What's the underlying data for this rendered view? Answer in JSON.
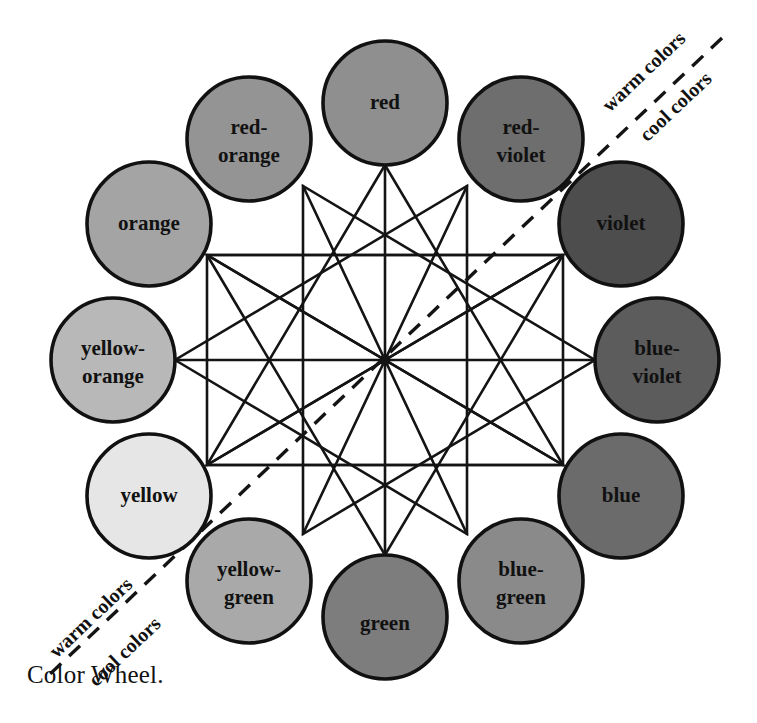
{
  "figure": {
    "caption": "Color Wheel.",
    "type": "diagram",
    "title": "Color Wheel",
    "center": {
      "x": 385,
      "y": 360
    },
    "wheel_radius": 272,
    "swatch_radius": 62
  },
  "divider": {
    "warm_label_top_right": "warm colors",
    "cool_label_top_right": "cool colors",
    "warm_label_bottom_left": "warm colors",
    "cool_label_bottom_left": "cool colors",
    "style": "dashed",
    "color": "#141414"
  },
  "swatches": [
    {
      "id": "red",
      "label": "red",
      "lines": [
        "red"
      ],
      "angle_deg": -90,
      "fill": "#8f8f8f",
      "stroke": "#111111",
      "family": "warm",
      "cx": 385,
      "cy": 103
    },
    {
      "id": "red-violet",
      "label": "red-violet",
      "lines": [
        "red-",
        "violet"
      ],
      "angle_deg": -60,
      "fill": "#6e6e6e",
      "stroke": "#111111",
      "family": "warm",
      "cx": 521,
      "cy": 139
    },
    {
      "id": "violet",
      "label": "violet",
      "lines": [
        "violet"
      ],
      "angle_deg": -30,
      "fill": "#4d4d4d",
      "stroke": "#111111",
      "family": "cool",
      "cx": 621,
      "cy": 224
    },
    {
      "id": "blue-violet",
      "label": "blue-violet",
      "lines": [
        "blue-",
        "violet"
      ],
      "angle_deg": 0,
      "fill": "#5c5c5c",
      "stroke": "#111111",
      "family": "cool",
      "cx": 657,
      "cy": 360
    },
    {
      "id": "blue",
      "label": "blue",
      "lines": [
        "blue"
      ],
      "angle_deg": 30,
      "fill": "#6b6b6b",
      "stroke": "#111111",
      "family": "cool",
      "cx": 621,
      "cy": 496
    },
    {
      "id": "blue-green",
      "label": "blue-green",
      "lines": [
        "blue-",
        "green"
      ],
      "angle_deg": 60,
      "fill": "#8a8a8a",
      "stroke": "#111111",
      "family": "cool",
      "cx": 521,
      "cy": 581
    },
    {
      "id": "green",
      "label": "green",
      "lines": [
        "green"
      ],
      "angle_deg": 90,
      "fill": "#7d7d7d",
      "stroke": "#111111",
      "family": "cool",
      "cx": 385,
      "cy": 617
    },
    {
      "id": "yellow-green",
      "label": "yellow-green",
      "lines": [
        "yellow-",
        "green"
      ],
      "angle_deg": 120,
      "fill": "#a9a9a9",
      "stroke": "#111111",
      "family": "warm",
      "cx": 249,
      "cy": 581
    },
    {
      "id": "yellow",
      "label": "yellow",
      "lines": [
        "yellow"
      ],
      "angle_deg": 150,
      "fill": "#e6e6e6",
      "stroke": "#111111",
      "family": "warm",
      "cx": 149,
      "cy": 496
    },
    {
      "id": "yellow-orange",
      "label": "yellow-orange",
      "lines": [
        "yellow-",
        "orange"
      ],
      "angle_deg": 180,
      "fill": "#b8b8b8",
      "stroke": "#111111",
      "family": "warm",
      "cx": 113,
      "cy": 360
    },
    {
      "id": "orange",
      "label": "orange",
      "lines": [
        "orange"
      ],
      "angle_deg": -150,
      "fill": "#a4a4a4",
      "stroke": "#111111",
      "family": "warm",
      "cx": 149,
      "cy": 224
    },
    {
      "id": "red-orange",
      "label": "red-orange",
      "lines": [
        "red-",
        "orange"
      ],
      "angle_deg": -120,
      "fill": "#949494",
      "stroke": "#111111",
      "family": "warm",
      "cx": 249,
      "cy": 139
    }
  ],
  "connections": {
    "diameters": [
      [
        "red",
        "green"
      ],
      [
        "red-violet",
        "yellow-green"
      ],
      [
        "violet",
        "yellow"
      ],
      [
        "blue-violet",
        "yellow-orange"
      ],
      [
        "blue",
        "orange"
      ],
      [
        "blue-green",
        "red-orange"
      ]
    ],
    "triangles": [
      [
        "red",
        "yellow",
        "blue"
      ],
      [
        "orange",
        "green",
        "violet"
      ],
      [
        "red-orange",
        "yellow-green",
        "blue-violet"
      ],
      [
        "yellow-orange",
        "blue-green",
        "red-violet"
      ]
    ],
    "rectangles": [
      [
        "orange",
        "yellow-orange",
        "blue",
        "violet"
      ],
      [
        "yellow",
        "yellow-orange",
        "violet",
        "blue-violet"
      ]
    ]
  }
}
